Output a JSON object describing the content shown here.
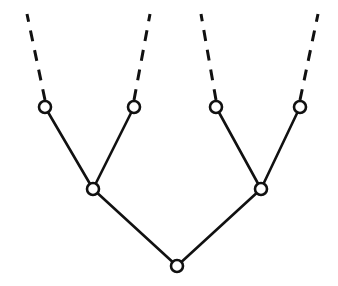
{
  "diagram": {
    "type": "tree",
    "background_color": "#ffffff",
    "stroke_color": "#111111",
    "node_fill_color": "#ffffff",
    "canvas": {
      "width": 338,
      "height": 286
    },
    "node_radius": 6,
    "solid_stroke_width": 2.6,
    "dashed_stroke_width": 3.0,
    "dash_pattern": "11 9",
    "nodes": [
      {
        "id": "root",
        "label": "root node",
        "role": "root",
        "x": 177,
        "y": 266
      },
      {
        "id": "int-L",
        "label": "left internal node",
        "role": "internal",
        "x": 93,
        "y": 189
      },
      {
        "id": "int-R",
        "label": "right internal node",
        "role": "internal",
        "x": 261,
        "y": 189
      },
      {
        "id": "leaf-1",
        "label": "leaf node 1",
        "role": "leaf",
        "x": 45,
        "y": 107
      },
      {
        "id": "leaf-2",
        "label": "leaf node 2",
        "role": "leaf",
        "x": 134,
        "y": 107
      },
      {
        "id": "leaf-3",
        "label": "leaf node 3",
        "role": "leaf",
        "x": 216,
        "y": 107
      },
      {
        "id": "leaf-4",
        "label": "leaf node 4",
        "role": "leaf",
        "x": 300,
        "y": 107
      }
    ],
    "solid_edges": [
      {
        "id": "edge-root-intL",
        "from": "root",
        "to": "int-L",
        "x1": 177,
        "y1": 266,
        "x2": 93,
        "y2": 189
      },
      {
        "id": "edge-root-intR",
        "from": "root",
        "to": "int-R",
        "x1": 177,
        "y1": 266,
        "x2": 261,
        "y2": 189
      },
      {
        "id": "edge-intL-leaf1",
        "from": "int-L",
        "to": "leaf-1",
        "x1": 93,
        "y1": 189,
        "x2": 45,
        "y2": 107
      },
      {
        "id": "edge-intL-leaf2",
        "from": "int-L",
        "to": "leaf-2",
        "x1": 93,
        "y1": 189,
        "x2": 134,
        "y2": 107
      },
      {
        "id": "edge-intR-leaf3",
        "from": "int-R",
        "to": "leaf-3",
        "x1": 261,
        "y1": 189,
        "x2": 216,
        "y2": 107
      },
      {
        "id": "edge-intR-leaf4",
        "from": "int-R",
        "to": "leaf-4",
        "x1": 261,
        "y1": 189,
        "x2": 300,
        "y2": 107
      }
    ],
    "dashed_edges": [
      {
        "id": "dashed-leaf1",
        "from": "leaf-1",
        "to": "open-1",
        "x1": 45,
        "y1": 100,
        "x2": 27,
        "y2": 14
      },
      {
        "id": "dashed-leaf2",
        "from": "leaf-2",
        "to": "open-2",
        "x1": 134,
        "y1": 100,
        "x2": 150,
        "y2": 14
      },
      {
        "id": "dashed-leaf3",
        "from": "leaf-3",
        "to": "open-3",
        "x1": 216,
        "y1": 100,
        "x2": 201,
        "y2": 14
      },
      {
        "id": "dashed-leaf4",
        "from": "leaf-4",
        "to": "open-4",
        "x1": 300,
        "y1": 100,
        "x2": 318,
        "y2": 14
      }
    ]
  }
}
